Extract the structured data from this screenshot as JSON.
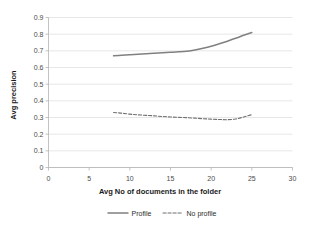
{
  "chart_data": {
    "type": "line",
    "title": "",
    "xlabel": "Avg No of documents in the folder",
    "ylabel": "Avg precision",
    "xlim": [
      0,
      30
    ],
    "ylim": [
      0,
      0.9
    ],
    "grid": true,
    "legend_position": "bottom",
    "x_ticks": [
      "0",
      "5",
      "10",
      "15",
      "20",
      "25",
      "30"
    ],
    "x_tick_values": [
      0,
      5,
      10,
      15,
      20,
      25,
      30
    ],
    "y_ticks": [
      "0",
      "0.1",
      "0.2",
      "0.3",
      "0.4",
      "0.5",
      "0.6",
      "0.7",
      "0.8",
      "0.9"
    ],
    "y_tick_values": [
      0,
      0.1,
      0.2,
      0.3,
      0.4,
      0.5,
      0.6,
      0.7,
      0.8,
      0.9
    ],
    "x": [
      8,
      9,
      10,
      11,
      12,
      13,
      14,
      15,
      16,
      17,
      18,
      19,
      20,
      21,
      22,
      23,
      24,
      25
    ],
    "series": [
      {
        "name": "Profile",
        "style": "solid",
        "color": "#808080",
        "values": [
          0.67,
          0.673,
          0.676,
          0.679,
          0.682,
          0.685,
          0.688,
          0.691,
          0.694,
          0.698,
          0.705,
          0.715,
          0.727,
          0.742,
          0.758,
          0.775,
          0.793,
          0.81
        ]
      },
      {
        "name": "No profile",
        "style": "dashed",
        "color": "#707070",
        "values": [
          0.33,
          0.326,
          0.32,
          0.316,
          0.313,
          0.31,
          0.306,
          0.303,
          0.301,
          0.299,
          0.296,
          0.293,
          0.29,
          0.288,
          0.287,
          0.291,
          0.303,
          0.317
        ]
      }
    ]
  },
  "legend": {
    "items": [
      {
        "label": "Profile"
      },
      {
        "label": "No profile"
      }
    ]
  },
  "colors": {
    "gridline": "#d7d7d7",
    "axis": "#b4b4b4",
    "text": "#4a4a4a",
    "series_profile": "#808080",
    "series_no_profile": "#707070"
  }
}
